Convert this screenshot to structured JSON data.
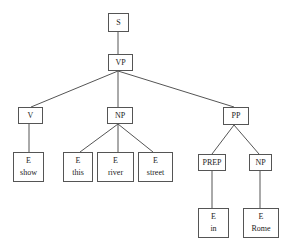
{
  "diagram": {
    "type": "parse-tree",
    "nodes": {
      "s": {
        "label": "S"
      },
      "vp": {
        "label": "VP"
      },
      "v": {
        "label": "V"
      },
      "np1": {
        "label": "NP"
      },
      "pp": {
        "label": "PP"
      },
      "e_show": {
        "label": "E",
        "word": "show"
      },
      "e_this": {
        "label": "E",
        "word": "this"
      },
      "e_river": {
        "label": "E",
        "word": "river"
      },
      "e_street": {
        "label": "E",
        "word": "street"
      },
      "prep": {
        "label": "PREP"
      },
      "np2": {
        "label": "NP"
      },
      "e_in": {
        "label": "E",
        "word": "in"
      },
      "e_rome": {
        "label": "E",
        "word": "Rome"
      }
    },
    "edges": [
      [
        "S",
        "VP"
      ],
      [
        "VP",
        "V"
      ],
      [
        "VP",
        "NP"
      ],
      [
        "VP",
        "PP"
      ],
      [
        "V",
        "E:show"
      ],
      [
        "NP",
        "E:this"
      ],
      [
        "NP",
        "E:river"
      ],
      [
        "NP",
        "E:street"
      ],
      [
        "PP",
        "PREP"
      ],
      [
        "PP",
        "NP"
      ],
      [
        "PREP",
        "E:in"
      ],
      [
        "NP",
        "E:Rome"
      ]
    ],
    "colors": {
      "stroke": "#555555",
      "text": "#222222",
      "background": "#ffffff"
    }
  }
}
